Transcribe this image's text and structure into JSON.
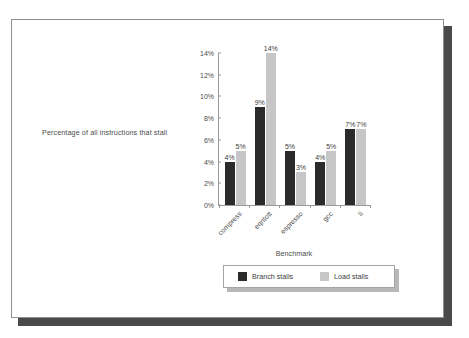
{
  "slide": {
    "background_color": "#ffffff",
    "frame_border_color": "#8e8e8e",
    "shadow_color": "#4a4a4a"
  },
  "chart_data": {
    "type": "bar",
    "title": "",
    "subtitle": "",
    "xlabel": "Benchmark",
    "ylabel": "Percentage of all instructions that stall",
    "categories": [
      "compress",
      "eqntott",
      "espresso",
      "gcc",
      "li"
    ],
    "series": [
      {
        "name": "Branch stalls",
        "color": "#2b2b2b",
        "values": [
          4,
          9,
          5,
          4,
          7
        ],
        "labels": [
          "4%",
          "9%",
          "5%",
          "4%",
          "7%"
        ]
      },
      {
        "name": "Load stalls",
        "color": "#c6c6c6",
        "values": [
          5,
          14,
          3,
          5,
          7
        ],
        "labels": [
          "5%",
          "14%",
          "3%",
          "5%",
          "7%"
        ]
      }
    ],
    "ylim": [
      0,
      14
    ],
    "ytick_values": [
      0,
      2,
      4,
      6,
      8,
      10,
      12,
      14
    ],
    "ytick_labels": [
      "0%",
      "2%",
      "4%",
      "6%",
      "8%",
      "10%",
      "12%",
      "14%"
    ],
    "grid": false,
    "legend_position": "bottom",
    "value_labels_shown": true,
    "xtick_label_rotation": -45
  },
  "legend": {
    "items": [
      {
        "label": "Branch stalls",
        "swatch": "branch-stalls-swatch"
      },
      {
        "label": "Load stalls",
        "swatch": "load-stalls-swatch"
      }
    ]
  }
}
